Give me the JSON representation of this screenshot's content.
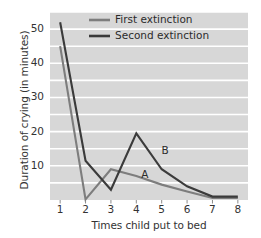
{
  "chart_data": {
    "type": "line",
    "title": "",
    "xlabel": "Times child put to bed",
    "ylabel": "Duration of crying (in minutes)",
    "x": [
      1,
      2,
      3,
      4,
      5,
      6,
      7,
      8
    ],
    "xticklabels": [
      "1",
      "2",
      "3",
      "4",
      "5",
      "6",
      "7",
      "8"
    ],
    "yticklabels": [
      "10",
      "20",
      "30",
      "40",
      "50"
    ],
    "yticks": [
      10,
      20,
      30,
      40,
      50
    ],
    "xlim": [
      0.6,
      8.4
    ],
    "ylim": [
      0,
      55
    ],
    "grid": "horizontal-white-minor-5",
    "legend_position": "top-center",
    "plot_background": "#d7d7d7",
    "gridline_color": "#ffffff",
    "series": [
      {
        "name": "First extinction",
        "annotation": "A",
        "color": "#7d7d7d",
        "values": [
          45,
          0.2,
          9,
          7,
          4.5,
          2.5,
          0.6,
          0.6
        ]
      },
      {
        "name": "Second extinction",
        "annotation": "B",
        "color": "#3b3b3b",
        "values": [
          52,
          11.5,
          3,
          19.5,
          9,
          4,
          1,
          1
        ]
      }
    ],
    "annotations": [
      {
        "text": "A",
        "x": 4.35,
        "y": 7.2
      },
      {
        "text": "B",
        "x": 5.15,
        "y": 14.2
      }
    ]
  },
  "legend": {
    "items": [
      {
        "label": "First extinction",
        "color": "#7d7d7d"
      },
      {
        "label": "Second extinction",
        "color": "#3b3b3b"
      }
    ]
  }
}
